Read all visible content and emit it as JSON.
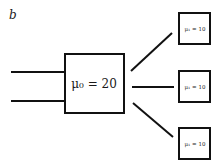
{
  "diagram": {
    "panel_label": "b",
    "source_node": {
      "label": "μ₀ = 20"
    },
    "target_nodes": [
      {
        "label": "μ₁ = 10"
      },
      {
        "label": "μ₁ = 10"
      },
      {
        "label": "μ₁ = 10"
      }
    ],
    "input_edges": 2,
    "output_edges": 3,
    "colors": {
      "stroke": "#111111",
      "background": "#ffffff"
    }
  }
}
